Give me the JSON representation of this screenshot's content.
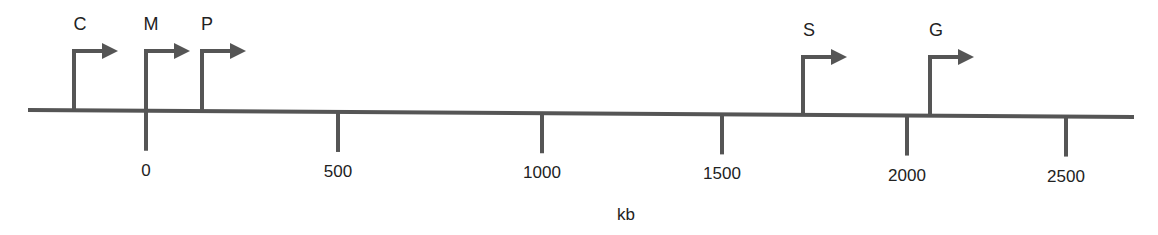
{
  "diagram": {
    "type": "genomic-map",
    "axis_unit": "kb",
    "axis": {
      "min_kb": -400,
      "max_kb": 2700,
      "color": "#555555"
    },
    "ticks": [
      {
        "value": 0,
        "label": "0",
        "x": 146
      },
      {
        "value": 500,
        "label": "500",
        "x": 338
      },
      {
        "value": 1000,
        "label": "1000",
        "x": 542
      },
      {
        "value": 1500,
        "label": "1500",
        "x": 722
      },
      {
        "value": 2000,
        "label": "2000",
        "x": 907
      },
      {
        "value": 2500,
        "label": "2500",
        "x": 1066
      }
    ],
    "promoters": [
      {
        "label": "C",
        "x": 74,
        "top": 51,
        "label_x": 80,
        "label_y": 14
      },
      {
        "label": "M",
        "x": 146,
        "top": 51,
        "label_x": 151,
        "label_y": 14
      },
      {
        "label": "P",
        "x": 202,
        "top": 51,
        "label_x": 207,
        "label_y": 14
      },
      {
        "label": "S",
        "x": 803,
        "top": 57,
        "label_x": 809,
        "label_y": 20
      },
      {
        "label": "G",
        "x": 930,
        "top": 57,
        "label_x": 936,
        "label_y": 20
      }
    ]
  }
}
